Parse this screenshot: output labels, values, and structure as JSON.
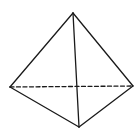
{
  "diagram": {
    "type": "tetrahedron",
    "background": "#ffffff",
    "stroke_color": "#1a1a1a",
    "vertices": {
      "top": [
        73,
        13
      ],
      "left": [
        10,
        87
      ],
      "right": [
        133,
        86
      ],
      "bottom": [
        79,
        127
      ]
    },
    "solid_edges": [
      [
        "top",
        "left"
      ],
      [
        "top",
        "right"
      ],
      [
        "top",
        "bottom"
      ],
      [
        "left",
        "bottom"
      ],
      [
        "right",
        "bottom"
      ]
    ],
    "hidden_edges": [
      [
        "left",
        "right"
      ]
    ]
  }
}
